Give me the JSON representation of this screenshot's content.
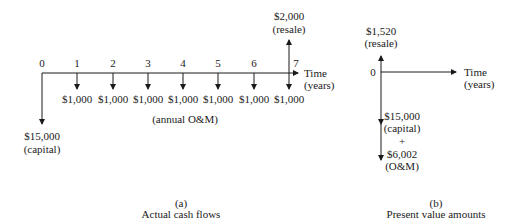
{
  "panel_a": {
    "ticks": [
      "0",
      "1",
      "2",
      "3",
      "4",
      "5",
      "6",
      "7"
    ],
    "annual_amounts": [
      "$1,000",
      "$1,000",
      "$1,000",
      "$1,000",
      "$1,000",
      "$1,000",
      "$1,000"
    ],
    "annual_label": "(annual O&M)",
    "capital_amount": "$15,000",
    "capital_label": "(capital)",
    "resale_amount": "$2,000",
    "resale_label": "(resale)",
    "axis_label_line1": "Time",
    "axis_label_line2": "(years)",
    "caption_letter": "(a)",
    "caption_text": "Actual cash flows"
  },
  "panel_b": {
    "origin": "0",
    "resale_amount": "$1,520",
    "resale_label": "(resale)",
    "capital_amount": "$15,000",
    "capital_label": "(capital)",
    "plus": "+",
    "om_amount": "$6,002",
    "om_label": "(O&M)",
    "axis_label_line1": "Time",
    "axis_label_line2": "(years)",
    "caption_letter": "(b)",
    "caption_text": "Present value amounts"
  }
}
